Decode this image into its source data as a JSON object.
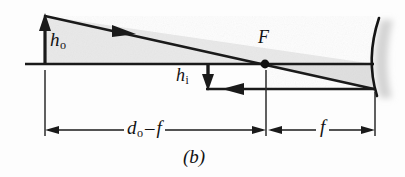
{
  "figure": {
    "caption": "(b)",
    "background_color": "#fdfdfd",
    "line_color": "#1a1a1a",
    "fill_color": "#e9e9e9",
    "shadow_color": "#cfcfcf"
  },
  "labels": {
    "object_height": {
      "symbol": "h",
      "subscript": "o"
    },
    "image_height": {
      "symbol": "h",
      "subscript": "i"
    },
    "focal_point": "F",
    "object_distance_minus_focal": {
      "symbol": "d",
      "subscript": "o",
      "operator": "–",
      "term": "f"
    },
    "focal_length": "f"
  },
  "geometry": {
    "axis": {
      "x_start": 25,
      "x_end": 374,
      "y": 64
    },
    "object_arrow": {
      "x": 45,
      "y_base": 64,
      "y_tip": 16
    },
    "image_arrow": {
      "x": 208,
      "y_base": 64,
      "y_tip": 89
    },
    "focal_point_dot": {
      "x": 265,
      "y": 64,
      "radius": 4
    },
    "mirror_vertex": {
      "x": 374,
      "y": 64
    },
    "mirror_arc": {
      "x_top": 379,
      "y_top": 18,
      "x_bottom": 377,
      "y_bottom": 96
    },
    "incident_ray": {
      "x1": 45,
      "y1": 16,
      "x2": 374,
      "y2": 89
    },
    "reflected_ray": {
      "x1": 374,
      "y1": 89,
      "x2": 208,
      "y2": 89
    },
    "ray_arrowhead_upper": {
      "x": 128,
      "y": 30,
      "direction": "right-down"
    },
    "ray_arrowhead_lower": {
      "x": 236,
      "y": 89,
      "direction": "left"
    },
    "dimension_line_y": 130,
    "dimension_left": {
      "x_start": 45,
      "x_end": 265
    },
    "dimension_right": {
      "x_start": 268,
      "x_end": 378
    }
  }
}
